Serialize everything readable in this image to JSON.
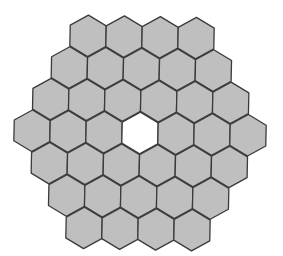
{
  "diagram": {
    "title": "",
    "colors": {
      "background": "#ffffff",
      "hex_fill": "#bfbfbf",
      "hex_stroke": "#3a3a3a",
      "empty_fill": "#ffffff"
    },
    "geometry": {
      "center_x": 140,
      "center_y": 133,
      "hex_width": 36,
      "row_step": 32,
      "rotation_deg": 1.2,
      "stroke_width": 1.3
    },
    "rows": [
      {
        "count": 4,
        "empty": []
      },
      {
        "count": 5,
        "empty": []
      },
      {
        "count": 6,
        "empty": []
      },
      {
        "count": 7,
        "empty": [
          3
        ]
      },
      {
        "count": 6,
        "empty": []
      },
      {
        "count": 5,
        "empty": []
      },
      {
        "count": 4,
        "empty": []
      }
    ],
    "total_filled_cells": 36,
    "empty_cells": 1
  }
}
